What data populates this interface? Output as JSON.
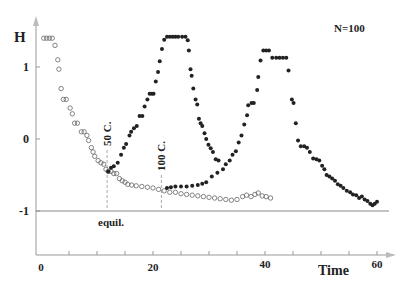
{
  "chart_data": {
    "type": "scatter",
    "title": "",
    "annotation_top_right": "N=100",
    "xlabel": "Time",
    "ylabel": "H",
    "xlim": [
      0,
      62
    ],
    "ylim": [
      -1.5,
      1.5
    ],
    "x_ticks": [
      0,
      20,
      40,
      60
    ],
    "x_minor_step": 5,
    "y_ticks": [
      1,
      0,
      -1
    ],
    "grid": false,
    "equilibrium": {
      "y": -1,
      "label": "equil."
    },
    "markers": [
      {
        "x": 11.8,
        "label": "50 C."
      },
      {
        "x": 21.5,
        "label": "100 C."
      }
    ],
    "series": [
      {
        "name": "cooling",
        "marker": "open-circle",
        "points": [
          [
            0.5,
            1.4
          ],
          [
            1.0,
            1.4
          ],
          [
            1.5,
            1.4
          ],
          [
            2.0,
            1.4
          ],
          [
            2.5,
            1.3
          ],
          [
            3.0,
            1.1
          ],
          [
            3.2,
            0.97
          ],
          [
            3.6,
            0.7
          ],
          [
            4.0,
            0.55
          ],
          [
            4.5,
            0.55
          ],
          [
            5.2,
            0.43
          ],
          [
            5.6,
            0.35
          ],
          [
            6.0,
            0.22
          ],
          [
            6.5,
            0.22
          ],
          [
            7.2,
            0.1
          ],
          [
            7.7,
            0.1
          ],
          [
            8.2,
            0.05
          ],
          [
            8.5,
            -0.02
          ],
          [
            9.0,
            -0.12
          ],
          [
            9.3,
            -0.18
          ],
          [
            9.6,
            -0.24
          ],
          [
            10.2,
            -0.3
          ],
          [
            10.7,
            -0.33
          ],
          [
            11.2,
            -0.35
          ],
          [
            11.6,
            -0.42
          ],
          [
            12.0,
            -0.45
          ],
          [
            12.5,
            -0.45
          ],
          [
            13.0,
            -0.48
          ],
          [
            13.5,
            -0.48
          ],
          [
            14.0,
            -0.55
          ],
          [
            14.5,
            -0.58
          ],
          [
            15.0,
            -0.6
          ],
          [
            15.5,
            -0.63
          ],
          [
            16.2,
            -0.64
          ],
          [
            17.0,
            -0.65
          ],
          [
            18.0,
            -0.66
          ],
          [
            19.0,
            -0.67
          ],
          [
            20.0,
            -0.68
          ],
          [
            21.0,
            -0.7
          ],
          [
            22.0,
            -0.72
          ],
          [
            23.0,
            -0.74
          ],
          [
            24.0,
            -0.74
          ],
          [
            25.0,
            -0.76
          ],
          [
            26.0,
            -0.77
          ],
          [
            27.0,
            -0.78
          ],
          [
            28.0,
            -0.79
          ],
          [
            29.0,
            -0.8
          ],
          [
            30.0,
            -0.81
          ],
          [
            31.0,
            -0.82
          ],
          [
            32.0,
            -0.83
          ],
          [
            33.0,
            -0.84
          ],
          [
            34.0,
            -0.85
          ],
          [
            35.0,
            -0.84
          ],
          [
            36.0,
            -0.8
          ],
          [
            36.7,
            -0.78
          ],
          [
            37.5,
            -0.8
          ],
          [
            38.2,
            -0.77
          ],
          [
            38.8,
            -0.75
          ],
          [
            39.5,
            -0.79
          ],
          [
            40.2,
            -0.8
          ],
          [
            41.0,
            -0.82
          ]
        ]
      },
      {
        "name": "heating",
        "marker": "filled-circle",
        "points": [
          [
            12.0,
            -0.45
          ],
          [
            12.5,
            -0.4
          ],
          [
            13.0,
            -0.38
          ],
          [
            13.7,
            -0.33
          ],
          [
            14.3,
            -0.22
          ],
          [
            14.8,
            -0.12
          ],
          [
            15.2,
            -0.07
          ],
          [
            15.8,
            0.05
          ],
          [
            16.1,
            0.1
          ],
          [
            16.6,
            0.15
          ],
          [
            17.1,
            0.18
          ],
          [
            17.6,
            0.32
          ],
          [
            18.1,
            0.32
          ],
          [
            18.5,
            0.45
          ],
          [
            19.0,
            0.55
          ],
          [
            19.4,
            0.63
          ],
          [
            19.8,
            0.63
          ],
          [
            20.1,
            0.63
          ],
          [
            20.5,
            0.8
          ],
          [
            20.9,
            0.93
          ],
          [
            21.2,
            1.08
          ],
          [
            21.6,
            1.25
          ],
          [
            22.0,
            1.38
          ],
          [
            22.5,
            1.42
          ],
          [
            23.0,
            1.42
          ],
          [
            23.5,
            1.42
          ],
          [
            24.0,
            1.42
          ],
          [
            24.5,
            1.42
          ],
          [
            25.2,
            1.42
          ],
          [
            25.8,
            1.42
          ],
          [
            26.2,
            1.37
          ],
          [
            26.4,
            1.23
          ],
          [
            26.7,
            0.97
          ],
          [
            26.9,
            0.88
          ],
          [
            27.2,
            0.7
          ],
          [
            27.6,
            0.55
          ],
          [
            27.9,
            0.48
          ],
          [
            28.2,
            0.28
          ],
          [
            28.5,
            0.22
          ],
          [
            28.8,
            0.18
          ],
          [
            29.2,
            0.08
          ],
          [
            29.5,
            0.0
          ],
          [
            29.9,
            -0.08
          ],
          [
            30.3,
            -0.13
          ],
          [
            30.7,
            -0.18
          ],
          [
            31.2,
            -0.28
          ],
          [
            31.7,
            -0.3
          ],
          [
            22.5,
            -0.68
          ],
          [
            23.2,
            -0.67
          ],
          [
            24.0,
            -0.66
          ],
          [
            25.0,
            -0.66
          ],
          [
            26.0,
            -0.66
          ],
          [
            27.0,
            -0.65
          ],
          [
            28.0,
            -0.64
          ],
          [
            28.8,
            -0.62
          ],
          [
            29.5,
            -0.6
          ],
          [
            30.5,
            -0.52
          ],
          [
            31.5,
            -0.47
          ],
          [
            32.5,
            -0.42
          ],
          [
            33.0,
            -0.35
          ],
          [
            33.7,
            -0.3
          ],
          [
            34.2,
            -0.22
          ],
          [
            34.8,
            -0.17
          ],
          [
            35.3,
            -0.05
          ],
          [
            35.8,
            0.05
          ],
          [
            36.3,
            0.2
          ],
          [
            36.8,
            0.33
          ],
          [
            37.0,
            0.47
          ],
          [
            37.6,
            0.5
          ],
          [
            38.0,
            0.5
          ],
          [
            38.6,
            0.68
          ],
          [
            38.8,
            0.86
          ],
          [
            39.2,
            1.09
          ],
          [
            39.7,
            1.23
          ],
          [
            40.2,
            1.23
          ],
          [
            40.7,
            1.23
          ],
          [
            41.3,
            1.13
          ],
          [
            42.0,
            1.13
          ],
          [
            42.6,
            1.13
          ],
          [
            43.2,
            1.13
          ],
          [
            43.8,
            1.13
          ],
          [
            44.2,
            0.95
          ],
          [
            44.8,
            0.55
          ],
          [
            45.1,
            0.5
          ],
          [
            45.5,
            0.22
          ],
          [
            45.9,
            -0.02
          ],
          [
            46.4,
            -0.1
          ],
          [
            47.0,
            -0.1
          ],
          [
            47.5,
            -0.12
          ],
          [
            48.0,
            -0.18
          ],
          [
            48.6,
            -0.27
          ],
          [
            49.2,
            -0.28
          ],
          [
            49.7,
            -0.3
          ],
          [
            50.2,
            -0.37
          ],
          [
            50.6,
            -0.42
          ],
          [
            51.0,
            -0.5
          ],
          [
            51.5,
            -0.52
          ],
          [
            52.0,
            -0.55
          ],
          [
            52.5,
            -0.58
          ],
          [
            53.0,
            -0.63
          ],
          [
            53.5,
            -0.65
          ],
          [
            54.0,
            -0.68
          ],
          [
            54.6,
            -0.72
          ],
          [
            55.2,
            -0.74
          ],
          [
            55.7,
            -0.77
          ],
          [
            56.3,
            -0.78
          ],
          [
            56.8,
            -0.82
          ],
          [
            57.3,
            -0.8
          ],
          [
            57.8,
            -0.84
          ],
          [
            58.3,
            -0.86
          ],
          [
            58.8,
            -0.9
          ],
          [
            59.2,
            -0.92
          ],
          [
            59.6,
            -0.9
          ],
          [
            60.0,
            -0.87
          ]
        ]
      }
    ]
  }
}
